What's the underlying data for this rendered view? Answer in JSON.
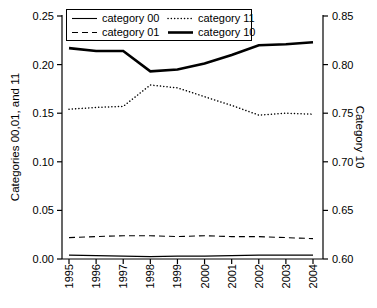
{
  "chart_data": {
    "type": "line",
    "title": "",
    "x_tick_labels": [
      "1995",
      "1996",
      "1997",
      "1998",
      "1999",
      "2000",
      "2001",
      "2002",
      "2003",
      "2004"
    ],
    "left_axis": {
      "label": "Categories 00,01, and 11",
      "range": [
        0.0,
        0.25
      ],
      "ticks": [
        "0.25",
        "0.20",
        "0.15",
        "0.10",
        "0.05",
        "0.00"
      ]
    },
    "right_axis": {
      "label": "Category 10",
      "range": [
        0.6,
        0.85
      ],
      "ticks": [
        "0.85",
        "0.80",
        "0.75",
        "0.70",
        "0.65",
        "0.60"
      ]
    },
    "grid": false,
    "legend_position": "top-left-inside",
    "series": [
      {
        "name": "category 00",
        "axis": "left",
        "line_style": "solid-thin",
        "values": [
          0.004,
          0.0035,
          0.003,
          0.0025,
          0.003,
          0.003,
          0.0035,
          0.004,
          0.004,
          0.004
        ]
      },
      {
        "name": "category 01",
        "axis": "left",
        "line_style": "dashed",
        "values": [
          0.022,
          0.023,
          0.024,
          0.024,
          0.023,
          0.024,
          0.023,
          0.023,
          0.022,
          0.021
        ]
      },
      {
        "name": "category 11",
        "axis": "left",
        "line_style": "dotted",
        "values": [
          0.154,
          0.156,
          0.157,
          0.179,
          0.176,
          0.167,
          0.158,
          0.148,
          0.15,
          0.149
        ]
      },
      {
        "name": "category 10",
        "axis": "right",
        "line_style": "solid-thick",
        "values": [
          0.817,
          0.814,
          0.814,
          0.793,
          0.795,
          0.801,
          0.81,
          0.82,
          0.821,
          0.823
        ]
      }
    ],
    "line_color": "#000000"
  },
  "legend": {
    "items": [
      {
        "label": "category 00",
        "line_style": "solid-thin"
      },
      {
        "label": "category 11",
        "line_style": "dotted"
      },
      {
        "label": "category 01",
        "line_style": "dashed"
      },
      {
        "label": "category 10",
        "line_style": "solid-thick"
      }
    ]
  }
}
